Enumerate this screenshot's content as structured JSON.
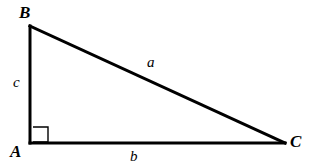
{
  "figure": {
    "type": "right-triangle-geometry-diagram",
    "canvas": {
      "width": 309,
      "height": 168,
      "background_color": "#ffffff"
    },
    "stroke_color": "#000000",
    "stroke_width_px": 3,
    "vertices": [
      {
        "name": "B",
        "label": "B",
        "x": 30,
        "y": 26
      },
      {
        "name": "A",
        "label": "A",
        "x": 30,
        "y": 143
      },
      {
        "name": "C",
        "label": "C",
        "x": 285,
        "y": 143
      }
    ],
    "edges": [
      {
        "name": "leg-c",
        "label": "c",
        "from": "B",
        "to": "A"
      },
      {
        "name": "leg-b",
        "label": "b",
        "from": "A",
        "to": "C"
      },
      {
        "name": "hypotenuse-a",
        "label": "a",
        "from": "B",
        "to": "C"
      }
    ],
    "right_angle": {
      "at_vertex": "A",
      "marker": "square",
      "size_px": 15,
      "stroke_width_px": 1.4
    },
    "vertex_labels": {
      "B": "B",
      "A": "A",
      "C": "C"
    },
    "side_labels": {
      "a": "a",
      "b": "b",
      "c": "c"
    }
  }
}
